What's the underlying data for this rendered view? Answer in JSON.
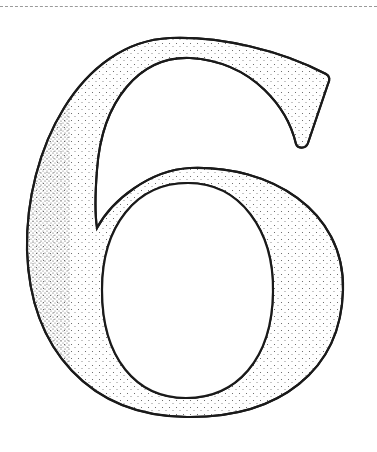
{
  "figure": {
    "glyph": "6",
    "style": "outlined with stipple shading",
    "colors": {
      "stroke": "#1a1a1a",
      "fill": "#ffffff",
      "stipple": "#555555",
      "top_rule": "#9a9a9a"
    }
  }
}
